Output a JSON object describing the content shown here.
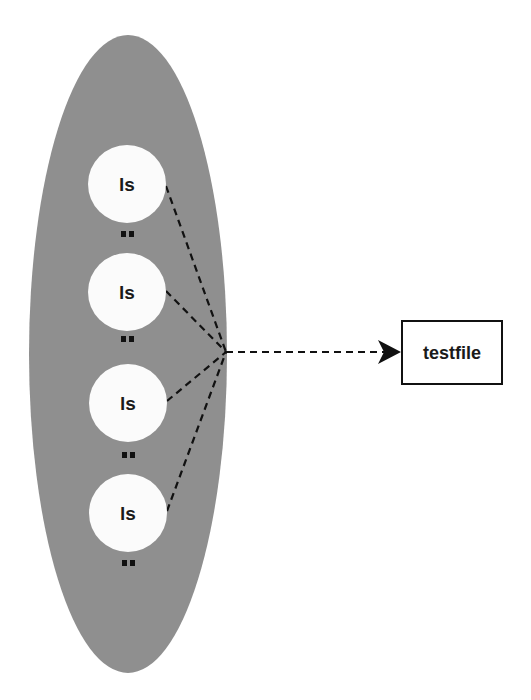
{
  "diagram": {
    "container": {
      "shape": "ellipse",
      "fill": "#8f8f8f",
      "cx": 128,
      "cy": 354,
      "rx": 99,
      "ry": 319
    },
    "processes": [
      {
        "label": "ls",
        "cx": 127,
        "cy": 184,
        "r": 39,
        "dots_y": 235,
        "line_start": [
          166,
          186
        ]
      },
      {
        "label": "ls",
        "cx": 127,
        "cy": 292,
        "r": 39,
        "dots_y": 339,
        "line_start": [
          166,
          291
        ]
      },
      {
        "label": "ls",
        "cx": 128,
        "cy": 403,
        "r": 39,
        "dots_y": 455,
        "line_start": [
          167,
          401
        ]
      },
      {
        "label": "ls",
        "cx": 128,
        "cy": 513,
        "r": 39,
        "dots_y": 563,
        "line_start": [
          167,
          511
        ]
      }
    ],
    "continuation_marker": "..",
    "convergence_point": [
      226,
      352
    ],
    "arrow": {
      "from": [
        226,
        352
      ],
      "to": [
        400,
        352
      ],
      "style": "dashed",
      "head": "filled-triangle"
    },
    "target": {
      "label": "testfile",
      "x": 402,
      "y": 321,
      "width": 100,
      "height": 64
    },
    "colors": {
      "ellipse_fill": "#8f8f8f",
      "circle_fill": "#fbfbfb",
      "line": "#111111",
      "text": "#1a1a1a"
    }
  }
}
